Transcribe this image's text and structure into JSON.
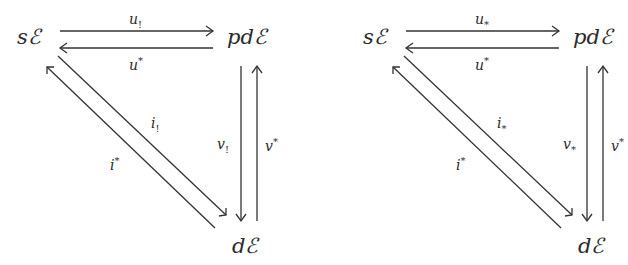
{
  "diagrams": [
    {
      "nodes": {
        "top_left": "sℰ",
        "top_right": "pdℰ",
        "bottom_right": "dℰ"
      },
      "arrows": {
        "top_forward": {
          "base": "u",
          "script": "!",
          "script_pos": "sub"
        },
        "top_backward": {
          "base": "u",
          "script": "*",
          "script_pos": "sup"
        },
        "diag_down": {
          "base": "i",
          "script": "!",
          "script_pos": "sub"
        },
        "diag_up": {
          "base": "i",
          "script": "*",
          "script_pos": "sup"
        },
        "vert_down": {
          "base": "v",
          "script": "!",
          "script_pos": "sub"
        },
        "vert_up": {
          "base": "v",
          "script": "*",
          "script_pos": "sup"
        }
      }
    },
    {
      "nodes": {
        "top_left": "sℰ",
        "top_right": "pdℰ",
        "bottom_right": "dℰ"
      },
      "arrows": {
        "top_forward": {
          "base": "u",
          "script": "*",
          "script_pos": "sub"
        },
        "top_backward": {
          "base": "u",
          "script": "*",
          "script_pos": "sup"
        },
        "diag_down": {
          "base": "i",
          "script": "*",
          "script_pos": "sub"
        },
        "diag_up": {
          "base": "i",
          "script": "*",
          "script_pos": "sup"
        },
        "vert_down": {
          "base": "v",
          "script": "*",
          "script_pos": "sub"
        },
        "vert_up": {
          "base": "v",
          "script": "*",
          "script_pos": "sup"
        }
      }
    }
  ]
}
